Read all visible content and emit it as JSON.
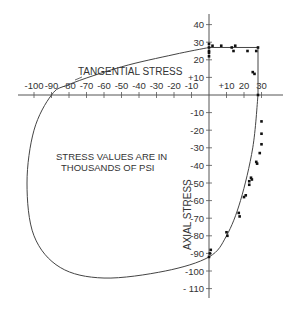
{
  "chart_data": {
    "type": "scatter",
    "title": "",
    "xlabel": "TANGENTIAL STRESS",
    "ylabel": "AXIAL STRESS",
    "annotation": [
      "STRESS VALUES ARE IN",
      "THOUSANDS OF PSI"
    ],
    "xlim": [
      -105,
      35
    ],
    "ylim": [
      -115,
      45
    ],
    "grid": false,
    "x_ticks": [
      -100,
      -90,
      -80,
      -70,
      -60,
      -50,
      -40,
      -30,
      -20,
      -10,
      10,
      20,
      30
    ],
    "x_tick_labels": [
      "-100",
      "-90",
      "-80",
      "-70",
      "-60",
      "-50",
      "-40",
      "-30",
      "-20",
      "-10",
      "+10",
      "20",
      "30"
    ],
    "y_ticks": [
      40,
      30,
      20,
      10,
      -10,
      -20,
      -30,
      -40,
      -50,
      -60,
      -70,
      -80,
      -90,
      -100,
      -110
    ],
    "y_tick_labels": [
      "40",
      "30",
      "20",
      "+10",
      "-10",
      "-20",
      "-30",
      "-40",
      "-50",
      "-60",
      "-70",
      "-80",
      "-90",
      "-100",
      "- 110"
    ],
    "series": [
      {
        "name": "Failure envelope",
        "kind": "curve",
        "points": [
          [
            28,
            27
          ],
          [
            28,
            0
          ],
          [
            25,
            -30
          ],
          [
            18,
            -60
          ],
          [
            10,
            -80
          ],
          [
            0,
            -92
          ],
          [
            -25,
            -100
          ],
          [
            -60,
            -104
          ],
          [
            -85,
            -98
          ],
          [
            -100,
            -80
          ],
          [
            -104,
            -50
          ],
          [
            -100,
            -20
          ],
          [
            -90,
            0
          ],
          [
            -80,
            6
          ],
          [
            -50,
            16
          ],
          [
            -20,
            23
          ],
          [
            0,
            27
          ],
          [
            28,
            27
          ]
        ]
      },
      {
        "name": "Test data",
        "kind": "scatter",
        "points": [
          [
            0,
            29
          ],
          [
            0,
            27
          ],
          [
            0,
            25
          ],
          [
            0,
            24
          ],
          [
            0,
            22
          ],
          [
            2,
            28
          ],
          [
            7,
            28
          ],
          [
            13,
            27
          ],
          [
            14,
            25
          ],
          [
            15,
            28
          ],
          [
            22,
            25
          ],
          [
            27,
            25
          ],
          [
            28,
            27
          ],
          [
            25,
            13
          ],
          [
            26,
            12
          ],
          [
            28,
            0
          ],
          [
            30,
            -15
          ],
          [
            30,
            -22
          ],
          [
            30,
            -28
          ],
          [
            29,
            -33
          ],
          [
            27,
            -38
          ],
          [
            27.5,
            -39
          ],
          [
            24,
            -47
          ],
          [
            24.5,
            -48
          ],
          [
            23,
            -49
          ],
          [
            23,
            -51
          ],
          [
            21,
            -57
          ],
          [
            20,
            -58
          ],
          [
            17,
            -67
          ],
          [
            17.5,
            -69
          ],
          [
            10,
            -78
          ],
          [
            10.5,
            -80
          ],
          [
            1,
            -88
          ],
          [
            0.5,
            -90
          ],
          [
            0,
            -92
          ]
        ]
      }
    ]
  }
}
